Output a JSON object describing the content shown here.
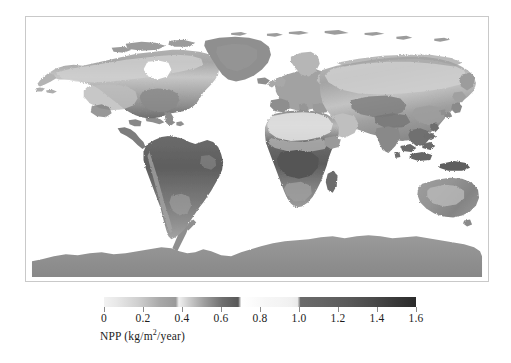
{
  "figure": {
    "kind": "global-npp-choropleth-map",
    "background_color": "#ffffff"
  },
  "map": {
    "name": "world-npp-map",
    "projection": "equirectangular",
    "frame_color": "#c9c9c9",
    "ocean_color": "#ffffff",
    "no_data_color": "#ffffff",
    "regions": [
      {
        "name": "north-america",
        "npp_class": "mixed-low-to-mid"
      },
      {
        "name": "greenland",
        "npp_class": "low"
      },
      {
        "name": "south-america",
        "npp_class": "high"
      },
      {
        "name": "europe",
        "npp_class": "mid"
      },
      {
        "name": "africa",
        "npp_class": "high-tropical"
      },
      {
        "name": "asia",
        "npp_class": "mixed"
      },
      {
        "name": "australia",
        "npp_class": "low-to-mid"
      },
      {
        "name": "antarctica",
        "npp_class": "low"
      }
    ]
  },
  "colorbar": {
    "title": "NPP (kg/m",
    "title_sup": "2",
    "title_tail": "/year)",
    "title_full": "NPP (kg/m2/year)",
    "units": "kg/m2/year",
    "min": 0,
    "max": 1.6,
    "tick_values": [
      0,
      0.2,
      0.4,
      0.6,
      0.8,
      1.0,
      1.2,
      1.4,
      1.6
    ],
    "tick_labels": [
      "0",
      "0.2",
      "0.4",
      "0.6",
      "0.8",
      "1.0",
      "1.2",
      "1.4",
      "1.6"
    ],
    "gradient_css": "linear-gradient(to right, #f2f2f2 0%, #e8e8e8 4%, #cfcfcf 11%, #a8a8a8 18%, #9a9a9a 23%, #f0f0f0 24%, #cfcfcf 27%, #9f9f9f 32%, #6e6e6e 38%, #585858 43%, #ffffff 44%, #fbfbfb 48%, #f6f6f6 52%, #f4f4f4 56%, #f0f0f0 60%, #eaeaea 62%, #6a6a6a 63%, #646464 70%, #5a5a5a 78%, #4b4b4b 86%, #3a3a3a 93%, #2a2a2a 100%)",
    "tick_color": "#8a8a8a",
    "label_color": "#1c1c1c"
  },
  "chart_data": {
    "type": "heatmap",
    "title": "",
    "xlabel": "",
    "ylabel": "",
    "colorbar_label": "NPP (kg/m2/year)",
    "colorbar_range": [
      0,
      1.6
    ],
    "colorbar_ticks": [
      0,
      0.2,
      0.4,
      0.6,
      0.8,
      1.0,
      1.2,
      1.4,
      1.6
    ],
    "grid": false,
    "legend_position": "bottom"
  }
}
